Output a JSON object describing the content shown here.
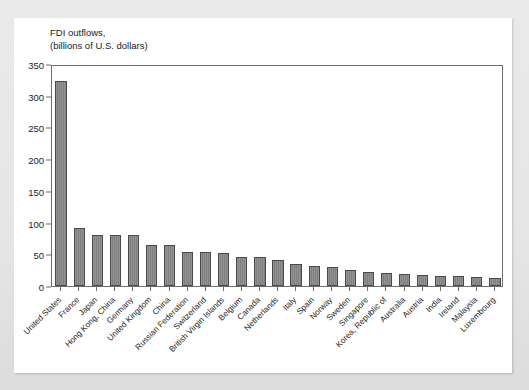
{
  "figure": {
    "title_line1": "FDI outflows,",
    "title_line2": "(billions of U.S. dollars)",
    "bar_color": "#808080",
    "bar_edge_color": "#4a4a4a",
    "axis_color": "#6d6d6d",
    "card_color": "#ffffff",
    "page_color": "#e8e8e8"
  },
  "chart_data": {
    "type": "bar",
    "title": "FDI outflows, (billions of U.S. dollars)",
    "xlabel": "",
    "ylabel": "FDI outflows, (billions of U.S. dollars)",
    "ylim": [
      0,
      350
    ],
    "yticks": [
      0,
      50,
      100,
      150,
      200,
      250,
      300,
      350
    ],
    "ytick_labels": [
      "0",
      "50",
      "100",
      "150",
      "200",
      "250",
      "300",
      "350"
    ],
    "grid": false,
    "legend": null,
    "categories": [
      "United States",
      "France",
      "Japan",
      "Hong Kong, China",
      "Germany",
      "United Kingdom",
      "China",
      "Russian Federation",
      "Switzerland",
      "British Virgin Islands",
      "Belgium",
      "Canada",
      "Netherlands",
      "Italy",
      "Spain",
      "Norway",
      "Sweden",
      "Singapore",
      "Korea, Republic of",
      "Australia",
      "Austria",
      "India",
      "Ireland",
      "Malaysia",
      "Luxembourg"
    ],
    "values": [
      324,
      91,
      80,
      80,
      80,
      65,
      64,
      54,
      54,
      52,
      46,
      46,
      41,
      35,
      31,
      30,
      25,
      22,
      21,
      19,
      18,
      16,
      16,
      15,
      13
    ]
  }
}
